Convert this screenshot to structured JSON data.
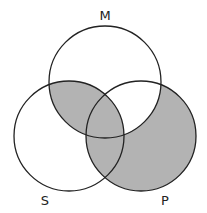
{
  "diagram": {
    "type": "venn-3",
    "labels": {
      "top": "M",
      "bottom_left": "S",
      "bottom_right": "P"
    },
    "colors": {
      "shade": "#b3b3b3",
      "stroke": "#222222",
      "background": "#ffffff"
    },
    "shaded_regions": [
      "S∩M only",
      "S∩M∩P",
      "S∩P only",
      "P only"
    ],
    "unshaded_regions": [
      "M only",
      "S only",
      "M∩P only"
    ]
  }
}
